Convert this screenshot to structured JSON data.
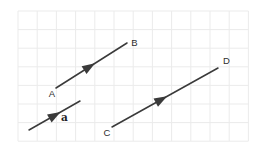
{
  "figure": {
    "background": "#ffffff",
    "stroke_color": "#3a3a3a",
    "label_color": "#2e2e2e",
    "grid": {
      "color": "#ebebeb",
      "x": 18,
      "y": 11,
      "cols": 12,
      "rows": 7,
      "cell_width": 19.2,
      "cell_height": 18.6
    },
    "vectors": [
      {
        "id": "AB",
        "x1": 56,
        "y1": 88,
        "x2": 127,
        "y2": 43,
        "arrow_t": 0.55
      },
      {
        "id": "CD",
        "x1": 112,
        "y1": 127,
        "x2": 218,
        "y2": 68,
        "arrow_t": 0.52
      },
      {
        "id": "a",
        "x1": 29,
        "y1": 130,
        "x2": 80,
        "y2": 101,
        "arrow_t": 0.62
      }
    ],
    "labels": [
      {
        "text": "A",
        "x": 52,
        "y": 96.5,
        "bold": false
      },
      {
        "text": "B",
        "x": 134.5,
        "y": 45.5,
        "bold": false
      },
      {
        "text": "C",
        "x": 107,
        "y": 135.5,
        "bold": false
      },
      {
        "text": "D",
        "x": 226.5,
        "y": 64,
        "bold": false
      },
      {
        "text": "a",
        "x": 64.5,
        "y": 121,
        "bold": true
      }
    ]
  }
}
